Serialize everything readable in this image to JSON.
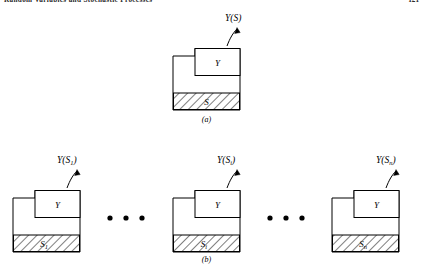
{
  "running_head": {
    "title": "Random Variables and Stochastic Processes",
    "page_number": "121"
  },
  "figure": {
    "panel_a": {
      "caption": "(a)",
      "unit": {
        "box_label": "Y",
        "base_label": "S",
        "base_label_sub": "",
        "output_label": "Y(S)",
        "output_label_base": "Y(S",
        "output_label_sub": "",
        "output_label_close": ")"
      }
    },
    "panel_b": {
      "caption": "(b)",
      "units": [
        {
          "box_label": "Y",
          "base_label": "S",
          "base_label_sub": "1",
          "output_label": "Y(S1)",
          "output_label_base": "Y(S",
          "output_label_sub": "1",
          "output_label_close": ")"
        },
        {
          "box_label": "Y",
          "base_label": "S",
          "base_label_sub": "i",
          "output_label": "Y(Si)",
          "output_label_base": "Y(S",
          "output_label_sub": "i",
          "output_label_close": ")"
        },
        {
          "box_label": "Y",
          "base_label": "S",
          "base_label_sub": "n",
          "output_label": "Y(Sn)",
          "output_label_base": "Y(S",
          "output_label_sub": "n",
          "output_label_close": ")"
        }
      ],
      "ellipsis_left": "• • •",
      "ellipsis_right": "• • •"
    }
  },
  "colors": {
    "ink": "#000000",
    "paper": "#ffffff",
    "head_ink": "#2a2a2a"
  }
}
